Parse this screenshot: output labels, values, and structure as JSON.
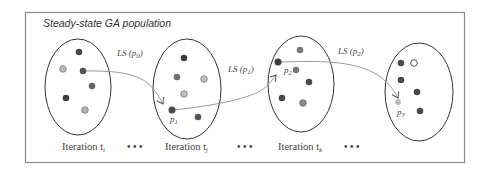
{
  "title": "Steady-state GA population",
  "colors": {
    "frame": "#8a8a8a",
    "ellipse": "#333333",
    "dark_dot": "#4a4a4a",
    "mid_dot": "#7a7a7a",
    "light_dot": "#b8b8b8",
    "arrow": "#9a9a9a"
  },
  "iterations": [
    {
      "label": "Iteration t",
      "subscript": "i"
    },
    {
      "label": "Iteration t",
      "subscript": "j"
    },
    {
      "label": "Iteration t",
      "subscript": "k"
    }
  ],
  "ellipsis": "• • •",
  "transitions": [
    {
      "label": "LS (p",
      "subscript": "0",
      "suffix": ")"
    },
    {
      "label": "LS (p",
      "subscript": "1",
      "suffix": ")"
    },
    {
      "label": "LS (p",
      "subscript": "2",
      "suffix": ")"
    }
  ],
  "points": [
    {
      "label": "p",
      "subscript": "1"
    },
    {
      "label": "p",
      "subscript": "2"
    },
    {
      "label": "p",
      "subscript": "3"
    }
  ]
}
